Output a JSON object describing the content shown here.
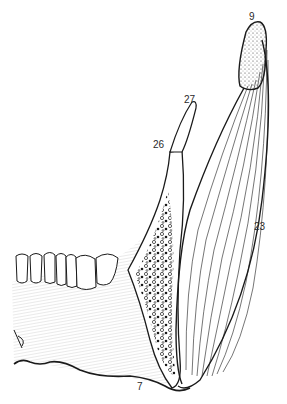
{
  "figure": {
    "colors": {
      "ink": "#1a1a1a",
      "background": "#ffffff",
      "hatch": "#8a8a8a"
    }
  },
  "labels": [
    {
      "id": "9",
      "text": "9"
    },
    {
      "id": "27",
      "text": "27"
    },
    {
      "id": "26",
      "text": "26"
    },
    {
      "id": "23",
      "text": "23"
    },
    {
      "id": "7",
      "text": "7"
    }
  ]
}
